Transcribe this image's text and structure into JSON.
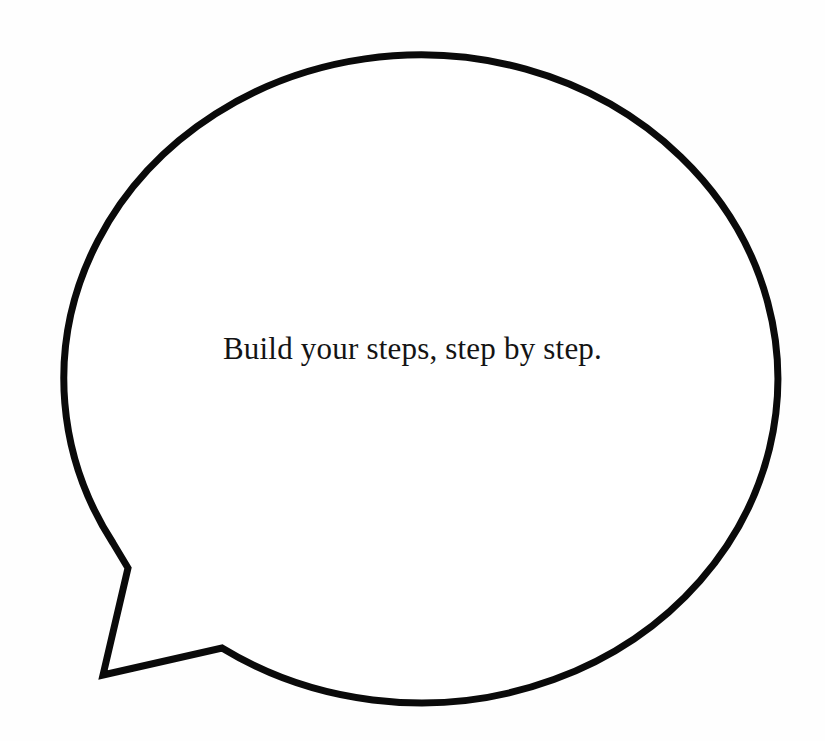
{
  "canvas": {
    "width": 825,
    "height": 741,
    "background_color": "#fefefe"
  },
  "speech_bubble": {
    "name": "speech-bubble",
    "shape": "ellipse-with-pointed-tail",
    "stroke_color": "#0a0a0a",
    "fill_color": "#ffffff",
    "stroke_width": 7,
    "ellipse": {
      "center_x": 412,
      "center_y": 374,
      "radius_x": 357,
      "radius_y": 324
    },
    "tail": {
      "name": "speech-bubble-tail",
      "direction": "lower-left",
      "vertices": [
        {
          "x": 113,
          "y": 543
        },
        {
          "x": 128,
          "y": 568
        },
        {
          "x": 103,
          "y": 675
        },
        {
          "x": 222,
          "y": 648
        }
      ]
    },
    "message": "Build your steps, step by step.",
    "text_color": "#141414",
    "text_font_size": 31,
    "text_center_x": 415,
    "text_baseline_y": 365
  }
}
